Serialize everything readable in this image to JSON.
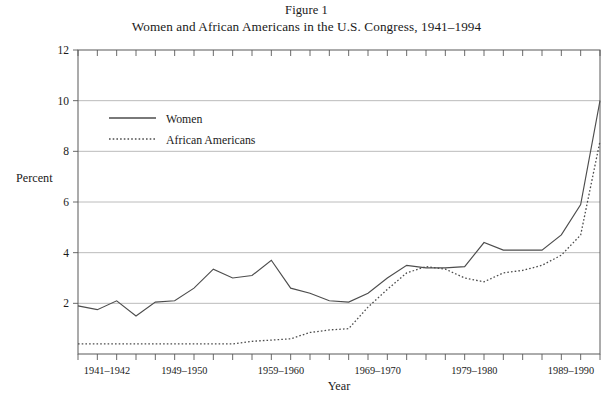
{
  "figure": {
    "label": "Figure 1",
    "title": "Women and African Americans in the U.S. Congress, 1941–1994"
  },
  "axes": {
    "y_title": "Percent",
    "x_title": "Year",
    "y_ticks": [
      "12",
      "10",
      "8",
      "6",
      "4",
      "2"
    ],
    "x_tick_labels": [
      "1941–1942",
      "1949–1950",
      "1959–1960",
      "1969–1970",
      "1979–1980",
      "1989–1990"
    ]
  },
  "legend": {
    "entries": [
      {
        "label": "Women",
        "style": "solid"
      },
      {
        "label": "African Americans",
        "style": "dotted"
      }
    ]
  },
  "footer": {
    "bleed_text": " "
  },
  "chart_data": {
    "type": "line",
    "title": "Women and African Americans in the U.S. Congress, 1941–1994",
    "subtitle": "Figure 1",
    "xlabel": "Year",
    "ylabel": "Percent",
    "ylim": [
      0,
      12
    ],
    "ytick_values": [
      0,
      2,
      4,
      6,
      8,
      10,
      12
    ],
    "grid": "horizontal",
    "legend_position": "upper-left-inside",
    "x": [
      "1941–1942",
      "1943–1944",
      "1945–1946",
      "1947–1948",
      "1949–1950",
      "1951–1952",
      "1953–1954",
      "1955–1956",
      "1957–1958",
      "1959–1960",
      "1961–1962",
      "1963–1964",
      "1965–1966",
      "1967–1968",
      "1969–1970",
      "1971–1972",
      "1973–1974",
      "1975–1976",
      "1977–1978",
      "1979–1980",
      "1981–1982",
      "1983–1984",
      "1985–1986",
      "1987–1988",
      "1989–1990",
      "1991–1992",
      "1993–1994",
      "1995–1996"
    ],
    "x_labeled_indices": [
      0,
      4,
      9,
      14,
      19,
      24
    ],
    "series": [
      {
        "name": "Women",
        "style": "solid",
        "values": [
          1.9,
          1.75,
          2.1,
          1.5,
          2.05,
          2.1,
          2.6,
          3.35,
          3.0,
          3.1,
          3.7,
          2.6,
          2.4,
          2.1,
          2.05,
          2.4,
          3.0,
          3.5,
          3.4,
          3.4,
          3.45,
          4.4,
          4.1,
          4.1,
          4.1,
          4.7,
          5.9,
          10.0
        ],
        "color": "#4d4d4d"
      },
      {
        "name": "African Americans",
        "style": "dotted",
        "values": [
          0.4,
          0.4,
          0.4,
          0.4,
          0.4,
          0.4,
          0.4,
          0.4,
          0.4,
          0.5,
          0.55,
          0.6,
          0.85,
          0.95,
          1.0,
          1.85,
          2.55,
          3.2,
          3.45,
          3.35,
          3.0,
          2.85,
          3.2,
          3.3,
          3.5,
          3.9,
          4.7,
          8.4
        ],
        "color": "#4d4d4d"
      }
    ]
  }
}
